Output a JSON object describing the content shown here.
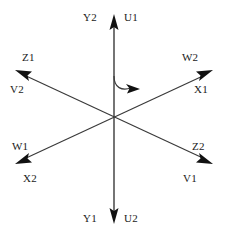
{
  "diagram": {
    "type": "six-phase-axis-vector-diagram",
    "background_color": "#ffffff",
    "line_color": "#3a3a3a",
    "text_color": "#1a1a1a",
    "center": {
      "x": 114,
      "y": 117
    },
    "axes": [
      {
        "name": "vertical-axis",
        "angle_deg": 90,
        "tip_top": {
          "x": 114,
          "y": 16
        },
        "tip_bottom": {
          "x": 114,
          "y": 222
        },
        "arrowheads": [
          "top",
          "bottom"
        ]
      },
      {
        "name": "diagonal-axis-ne-sw",
        "angle_deg": 30,
        "tip_ne": {
          "x": 211,
          "y": 72
        },
        "tip_sw": {
          "x": 17,
          "y": 162
        },
        "arrowheads": [
          "ne",
          "sw"
        ]
      },
      {
        "name": "diagonal-axis-nw-se",
        "angle_deg": 150,
        "tip_nw": {
          "x": 17,
          "y": 72
        },
        "tip_se": {
          "x": 211,
          "y": 162
        },
        "arrowheads": [
          "nw",
          "se"
        ]
      }
    ],
    "rotation_arc": {
      "name": "rotation-direction-arc",
      "start": {
        "x": 114,
        "y": 76
      },
      "end": {
        "x": 137,
        "y": 90
      },
      "direction": "clockwise"
    },
    "labels": [
      {
        "id": "y2",
        "text": "Y2",
        "x": 83,
        "y": 12,
        "anchor": "top-up-left"
      },
      {
        "id": "u1",
        "text": "U1",
        "x": 124,
        "y": 12,
        "anchor": "top-up-right"
      },
      {
        "id": "z1",
        "text": "Z1",
        "x": 22,
        "y": 52,
        "anchor": "upper-left-above"
      },
      {
        "id": "v2",
        "text": "V2",
        "x": 10,
        "y": 84,
        "anchor": "upper-left-below"
      },
      {
        "id": "w2",
        "text": "W2",
        "x": 182,
        "y": 52,
        "anchor": "upper-right-above"
      },
      {
        "id": "x1",
        "text": "X1",
        "x": 194,
        "y": 84,
        "anchor": "upper-right-below"
      },
      {
        "id": "w1",
        "text": "W1",
        "x": 12,
        "y": 141,
        "anchor": "lower-left-above"
      },
      {
        "id": "x2",
        "text": "X2",
        "x": 23,
        "y": 173,
        "anchor": "lower-left-below"
      },
      {
        "id": "z2",
        "text": "Z2",
        "x": 192,
        "y": 141,
        "anchor": "lower-right-above"
      },
      {
        "id": "v1",
        "text": "V1",
        "x": 183,
        "y": 173,
        "anchor": "lower-right-below"
      },
      {
        "id": "y1",
        "text": "Y1",
        "x": 83,
        "y": 213,
        "anchor": "bottom-down-left"
      },
      {
        "id": "u2",
        "text": "U2",
        "x": 124,
        "y": 213,
        "anchor": "bottom-down-right"
      }
    ]
  }
}
